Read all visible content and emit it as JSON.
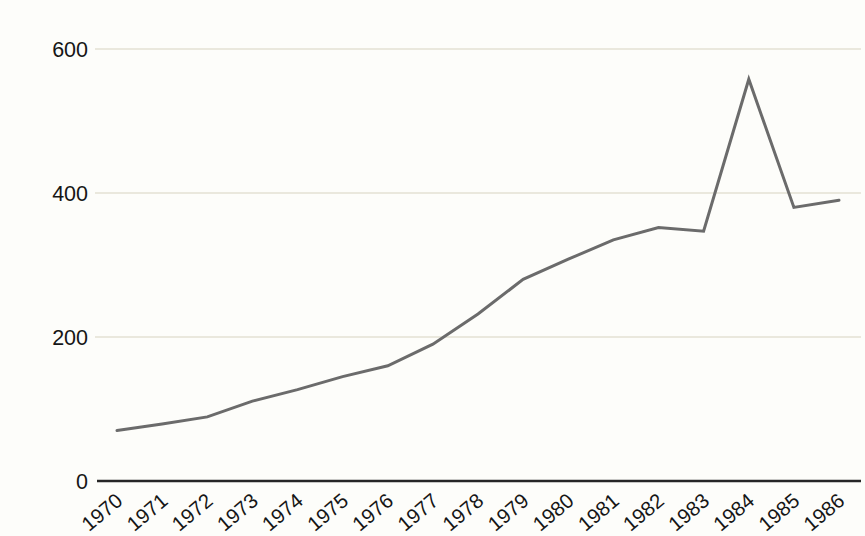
{
  "chart_data": {
    "type": "line",
    "title": "",
    "xlabel": "",
    "ylabel": "",
    "categories": [
      "1970",
      "1971",
      "1972",
      "1973",
      "1974",
      "1975",
      "1976",
      "1977",
      "1978",
      "1979",
      "1980",
      "1981",
      "1982",
      "1983",
      "1984",
      "1985",
      "1986"
    ],
    "series": [
      {
        "name": "series-1",
        "values": [
          70,
          79,
          89,
          111,
          127,
          145,
          160,
          190,
          232,
          280,
          308,
          335,
          352,
          347,
          558,
          380,
          390
        ]
      }
    ],
    "ylim": [
      0,
      600
    ],
    "yticks": [
      0,
      200,
      400,
      600
    ],
    "grid": "horizontal",
    "legend": "none",
    "colors": {
      "line": "#6b6b6b",
      "gridline": "#d7d4bf",
      "axis": "#262626",
      "tick_text": "#161616",
      "background": "#fdfdfa"
    }
  }
}
